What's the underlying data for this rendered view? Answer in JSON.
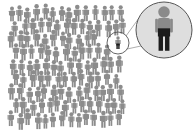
{
  "illustration": {
    "description": "Crowd of people with one individual highlighted and magnified",
    "colors": {
      "background": "#ffffff",
      "crowd_figure": "#8c8c8c",
      "highlight_body": "#8a8a8a",
      "highlight_legs": "#1c1c1c",
      "magnifier_fill": "#dedede",
      "magnifier_stroke": "#555555",
      "connector_line": "#777777"
    },
    "crowd": {
      "columns": 14,
      "rows": 9,
      "origin_x": 12,
      "origin_y": 14,
      "spacing_x": 8.3,
      "spacing_y": 13.2
    },
    "highlight": {
      "x": 118,
      "y": 43,
      "ring_radius": 11
    },
    "magnifier": {
      "cx": 164,
      "cy": 30,
      "r": 28
    }
  }
}
